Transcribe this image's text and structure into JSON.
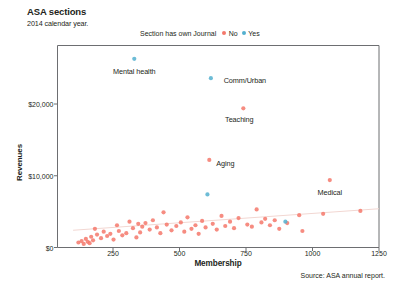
{
  "header": {
    "title": "ASA sections",
    "subtitle": "2014 calendar year."
  },
  "footer": {
    "source": "Source: ASA annual report."
  },
  "legend": {
    "title": "Section has own Journal",
    "entries": [
      {
        "label": "No",
        "color": "#f4786b"
      },
      {
        "label": "Yes",
        "color": "#53b0cf"
      }
    ]
  },
  "chart_data": {
    "type": "scatter",
    "title": "ASA sections",
    "subtitle": "2014 calendar year.",
    "xlabel": "Membership",
    "ylabel": "Revenues",
    "xlim": [
      0,
      1250
    ],
    "ylim": [
      0,
      28500
    ],
    "xticks": [
      250,
      500,
      750,
      1000,
      1250
    ],
    "xtick_labels": [
      "250",
      "500",
      "750",
      "1000",
      "1250"
    ],
    "yticks": [
      0,
      10000,
      20000
    ],
    "ytick_labels": [
      "$0",
      "$10,000",
      "$20,000"
    ],
    "grid": false,
    "legend_position": "top-center",
    "legend_title": "Section has own Journal",
    "colors": {
      "no_journal": "#f4786b",
      "yes_journal": "#53b0cf",
      "trendline": "#f2d7d2",
      "axis": "#6d6e71"
    },
    "series": [
      {
        "name": "No",
        "color": "#f4786b",
        "points": [
          {
            "x": 120,
            "y": 700
          },
          {
            "x": 132,
            "y": 900
          },
          {
            "x": 140,
            "y": 500
          },
          {
            "x": 148,
            "y": 1200
          },
          {
            "x": 155,
            "y": 800
          },
          {
            "x": 162,
            "y": 600
          },
          {
            "x": 168,
            "y": 1500
          },
          {
            "x": 175,
            "y": 1000
          },
          {
            "x": 182,
            "y": 2600
          },
          {
            "x": 190,
            "y": 1800
          },
          {
            "x": 205,
            "y": 1300
          },
          {
            "x": 215,
            "y": 2200
          },
          {
            "x": 228,
            "y": 1600
          },
          {
            "x": 240,
            "y": 1900
          },
          {
            "x": 252,
            "y": 1100
          },
          {
            "x": 265,
            "y": 3100
          },
          {
            "x": 272,
            "y": 2300
          },
          {
            "x": 285,
            "y": 1700
          },
          {
            "x": 300,
            "y": 2000
          },
          {
            "x": 312,
            "y": 3600
          },
          {
            "x": 325,
            "y": 2700
          },
          {
            "x": 338,
            "y": 1400
          },
          {
            "x": 345,
            "y": 3300
          },
          {
            "x": 352,
            "y": 2100
          },
          {
            "x": 360,
            "y": 2900
          },
          {
            "x": 372,
            "y": 3400
          },
          {
            "x": 388,
            "y": 2500
          },
          {
            "x": 400,
            "y": 3800
          },
          {
            "x": 415,
            "y": 2800
          },
          {
            "x": 428,
            "y": 2000
          },
          {
            "x": 440,
            "y": 4900
          },
          {
            "x": 452,
            "y": 3200
          },
          {
            "x": 470,
            "y": 2400
          },
          {
            "x": 488,
            "y": 3000
          },
          {
            "x": 505,
            "y": 3500
          },
          {
            "x": 518,
            "y": 2200
          },
          {
            "x": 530,
            "y": 4200
          },
          {
            "x": 545,
            "y": 2600
          },
          {
            "x": 560,
            "y": 3100
          },
          {
            "x": 572,
            "y": 1900
          },
          {
            "x": 585,
            "y": 3700
          },
          {
            "x": 598,
            "y": 2800
          },
          {
            "x": 612,
            "y": 12200
          },
          {
            "x": 625,
            "y": 3300
          },
          {
            "x": 640,
            "y": 2500
          },
          {
            "x": 658,
            "y": 4400
          },
          {
            "x": 672,
            "y": 3000
          },
          {
            "x": 690,
            "y": 3600
          },
          {
            "x": 705,
            "y": 2700
          },
          {
            "x": 722,
            "y": 4100
          },
          {
            "x": 740,
            "y": 19400
          },
          {
            "x": 755,
            "y": 3200
          },
          {
            "x": 772,
            "y": 2900
          },
          {
            "x": 790,
            "y": 5300
          },
          {
            "x": 808,
            "y": 3500
          },
          {
            "x": 822,
            "y": 4000
          },
          {
            "x": 840,
            "y": 3100
          },
          {
            "x": 858,
            "y": 3800
          },
          {
            "x": 875,
            "y": 2600
          },
          {
            "x": 905,
            "y": 3400
          },
          {
            "x": 950,
            "y": 4500
          },
          {
            "x": 962,
            "y": 2300
          },
          {
            "x": 1040,
            "y": 4700
          },
          {
            "x": 1065,
            "y": 9400
          },
          {
            "x": 1180,
            "y": 5100
          }
        ]
      },
      {
        "name": "Yes",
        "color": "#53b0cf",
        "points": [
          {
            "x": 330,
            "y": 26300
          },
          {
            "x": 618,
            "y": 23600
          },
          {
            "x": 605,
            "y": 7400
          },
          {
            "x": 898,
            "y": 3600
          }
        ]
      }
    ],
    "trendline": {
      "x0": 100,
      "y0": 2400,
      "x1": 1250,
      "y1": 5400
    },
    "annotations": [
      {
        "label": "Mental health",
        "x": 330,
        "y": 26300,
        "journal": "Yes",
        "label_dx": 0,
        "label_dy": 12
      },
      {
        "label": "Comm/Urban",
        "x": 618,
        "y": 23600,
        "journal": "Yes",
        "label_dx": 34,
        "label_dy": 2
      },
      {
        "label": "Teaching",
        "x": 740,
        "y": 19400,
        "journal": "No",
        "label_dx": -4,
        "label_dy": 11
      },
      {
        "label": "Aging",
        "x": 612,
        "y": 12200,
        "journal": "No",
        "label_dx": 16,
        "label_dy": 3
      },
      {
        "label": "Medical",
        "x": 1065,
        "y": 9400,
        "journal": "No",
        "label_dx": 0,
        "label_dy": 12
      }
    ]
  }
}
